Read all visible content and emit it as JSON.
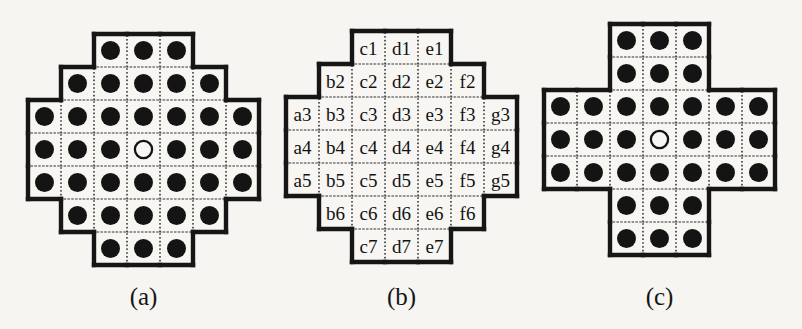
{
  "figure": {
    "cell_px": 33,
    "colors": {
      "page_bg": "#f6f5f1",
      "cell_bg": "#f8f6f2",
      "outline": "#161616",
      "grid_dots": "#3c3c3c",
      "peg": "#141414",
      "label_text": "#121212"
    },
    "boards": [
      {
        "caption": "(a)",
        "rows": [
          [
            "",
            "",
            "peg",
            "peg",
            "peg",
            "",
            ""
          ],
          [
            "",
            "peg",
            "peg",
            "peg",
            "peg",
            "peg",
            ""
          ],
          [
            "peg",
            "peg",
            "peg",
            "peg",
            "peg",
            "peg",
            "peg"
          ],
          [
            "peg",
            "peg",
            "peg",
            "open",
            "peg",
            "peg",
            "peg"
          ],
          [
            "peg",
            "peg",
            "peg",
            "peg",
            "peg",
            "peg",
            "peg"
          ],
          [
            "",
            "peg",
            "peg",
            "peg",
            "peg",
            "peg",
            ""
          ],
          [
            "",
            "",
            "peg",
            "peg",
            "peg",
            "",
            ""
          ]
        ]
      },
      {
        "caption": "(b)",
        "rows": [
          [
            "",
            "",
            "c1",
            "d1",
            "e1",
            "",
            ""
          ],
          [
            "",
            "b2",
            "c2",
            "d2",
            "e2",
            "f2",
            ""
          ],
          [
            "a3",
            "b3",
            "c3",
            "d3",
            "e3",
            "f3",
            "g3"
          ],
          [
            "a4",
            "b4",
            "c4",
            "d4",
            "e4",
            "f4",
            "g4"
          ],
          [
            "a5",
            "b5",
            "c5",
            "d5",
            "e5",
            "f5",
            "g5"
          ],
          [
            "",
            "b6",
            "c6",
            "d6",
            "e6",
            "f6",
            ""
          ],
          [
            "",
            "",
            "c7",
            "d7",
            "e7",
            "",
            ""
          ]
        ]
      },
      {
        "caption": "(c)",
        "rows": [
          [
            "",
            "",
            "peg",
            "peg",
            "peg",
            "",
            ""
          ],
          [
            "",
            "",
            "peg",
            "peg",
            "peg",
            "",
            ""
          ],
          [
            "peg",
            "peg",
            "peg",
            "peg",
            "peg",
            "peg",
            "peg"
          ],
          [
            "peg",
            "peg",
            "peg",
            "open",
            "peg",
            "peg",
            "peg"
          ],
          [
            "peg",
            "peg",
            "peg",
            "peg",
            "peg",
            "peg",
            "peg"
          ],
          [
            "",
            "",
            "peg",
            "peg",
            "peg",
            "",
            ""
          ],
          [
            "",
            "",
            "peg",
            "peg",
            "peg",
            "",
            ""
          ]
        ]
      }
    ]
  }
}
